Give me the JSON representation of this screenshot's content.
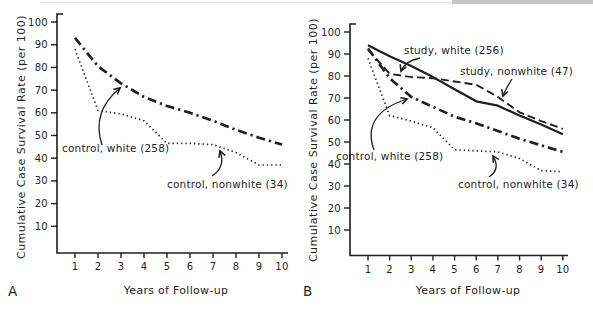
{
  "page": {
    "background": "#ffffff",
    "ink_color": "#1f1f1f",
    "scan_strip_color": "#c6c6c6",
    "scan_line_color": "#e7e7e7"
  },
  "chart_data": [
    {
      "type": "line",
      "panel_letter": "A",
      "xlabel": "Years of Follow-up",
      "ylabel": "Cumulative Case Survival Rate (per 100)",
      "x": [
        1,
        2,
        3,
        4,
        5,
        6,
        7,
        8,
        9,
        10
      ],
      "x_ticks": [
        "1",
        "2",
        "3",
        "4",
        "5",
        "6",
        "7",
        "8",
        "9",
        "10"
      ],
      "y_ticks": [
        10,
        20,
        30,
        40,
        50,
        60,
        70,
        80,
        90,
        100
      ],
      "ylim": [
        0,
        100
      ],
      "grid": false,
      "legend_position": "inline-annotations",
      "series": [
        {
          "name": "control-white",
          "label": "control, white (258)",
          "line_style": "dashdot",
          "values": [
            93,
            80.5,
            73,
            67,
            63,
            60,
            56.5,
            52.5,
            49,
            46
          ]
        },
        {
          "name": "control-nonwhite",
          "label": "control, nonwhite (34)",
          "line_style": "dotted",
          "values": [
            88,
            61,
            59.5,
            56.5,
            46.5,
            46.5,
            46,
            42.5,
            37,
            37
          ]
        }
      ]
    },
    {
      "type": "line",
      "panel_letter": "B",
      "xlabel": "Years of Follow-up",
      "ylabel": "Cumulative Case Survival Rate (per 100)",
      "x": [
        1,
        2,
        3,
        4,
        5,
        6,
        7,
        8,
        9,
        10
      ],
      "x_ticks": [
        "1",
        "2",
        "3",
        "4",
        "5",
        "6",
        "7",
        "8",
        "9",
        "10"
      ],
      "y_ticks": [
        10,
        20,
        30,
        40,
        50,
        60,
        70,
        80,
        90,
        100
      ],
      "ylim": [
        0,
        100
      ],
      "grid": false,
      "legend_position": "inline-annotations",
      "series": [
        {
          "name": "study-white",
          "label": "study, white (256)",
          "line_style": "solid",
          "values": [
            94,
            89,
            84.5,
            79.5,
            74,
            68.5,
            66.5,
            62,
            58,
            53.5
          ]
        },
        {
          "name": "study-nonwhite",
          "label": "study, nonwhite (47)",
          "line_style": "dashed",
          "values": [
            92,
            81,
            79.5,
            79,
            77.5,
            76,
            70.5,
            63.5,
            59.5,
            56
          ]
        },
        {
          "name": "control-white",
          "label": "control, white (258)",
          "line_style": "dashdot",
          "values": [
            92.5,
            79,
            70.5,
            66,
            61.5,
            58.5,
            55,
            51.5,
            48.5,
            45.5
          ]
        },
        {
          "name": "control-nonwhite",
          "label": "control, nonwhite (34)",
          "line_style": "dotted",
          "values": [
            88,
            62,
            59.5,
            56.5,
            46.5,
            46,
            45.5,
            42.5,
            37,
            36.5
          ]
        }
      ]
    }
  ]
}
